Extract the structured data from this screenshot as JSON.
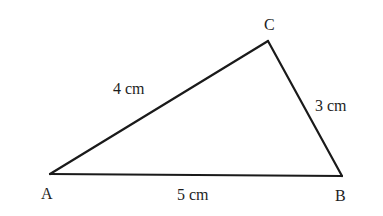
{
  "diagram": {
    "type": "triangle",
    "vertices": [
      {
        "name": "A",
        "label": "A",
        "x": 50,
        "y": 174,
        "label_x": 41,
        "label_y": 199
      },
      {
        "name": "B",
        "label": "B",
        "x": 342,
        "y": 176,
        "label_x": 335,
        "label_y": 201
      },
      {
        "name": "C",
        "label": "C",
        "x": 268,
        "y": 41,
        "label_x": 264,
        "label_y": 30
      }
    ],
    "sides": [
      {
        "name": "AC",
        "from": "A",
        "to": "C",
        "label": "4 cm",
        "label_x": 113,
        "label_y": 94
      },
      {
        "name": "CB",
        "from": "C",
        "to": "B",
        "label": "3 cm",
        "label_x": 315,
        "label_y": 111
      },
      {
        "name": "AB",
        "from": "A",
        "to": "B",
        "label": "5 cm",
        "label_x": 177,
        "label_y": 200
      }
    ],
    "colors": {
      "line": "#1a1a1a",
      "text": "#1e1e1e",
      "background": "#ffffff"
    }
  }
}
